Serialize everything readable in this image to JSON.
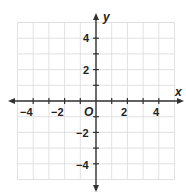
{
  "chart_data": {
    "type": "coordinate-grid",
    "title": "",
    "xlabel": "x",
    "ylabel": "y",
    "origin_label": "O",
    "xlim": [
      -5,
      5
    ],
    "ylim": [
      -5,
      5
    ],
    "grid": true,
    "grid_step": 1,
    "x_tick_labels": [
      "-4",
      "-2",
      "2",
      "4"
    ],
    "x_tick_values": [
      -4,
      -2,
      2,
      4
    ],
    "y_tick_labels": [
      "4",
      "2",
      "-2",
      "-4"
    ],
    "y_tick_values": [
      4,
      2,
      -2,
      -4
    ],
    "points": [],
    "colors": {
      "grid": "#d9d9d9",
      "axis": "#333333",
      "text": "#222222"
    }
  },
  "labels": {
    "x_axis": "x",
    "y_axis": "y",
    "origin": "O",
    "xticks": [
      "−4",
      "−2",
      "2",
      "4"
    ],
    "yticks": [
      "4",
      "2",
      "−2",
      "−4"
    ]
  }
}
